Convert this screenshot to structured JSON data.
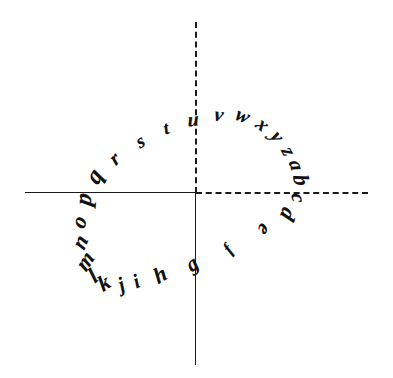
{
  "figure": {
    "title": "",
    "style": "hand-drawn-sketch",
    "background_color": "#ffffff",
    "ink_color": "#111111"
  },
  "axes": {
    "horizontal_left": {
      "name": "negative-x-axis",
      "stroke": "solid",
      "color": "#1a1a1a"
    },
    "horizontal_right": {
      "name": "positive-x-axis",
      "stroke": "dashed",
      "color": "#1a1a1a"
    },
    "vertical_up": {
      "name": "positive-y-axis",
      "stroke": "dashed",
      "color": "#1a1a1a"
    },
    "vertical_down": {
      "name": "negative-y-axis",
      "stroke": "solid",
      "color": "#1a1a1a"
    },
    "origin": {
      "x": 196,
      "y": 192
    }
  },
  "chart_data": {
    "type": "scatter",
    "title": "",
    "xlabel": "",
    "ylabel": "",
    "labels": [
      "f",
      "g",
      "h",
      "i",
      "j",
      "k",
      "l",
      "m",
      "n",
      "o",
      "p",
      "q",
      "r",
      "s",
      "t",
      "u",
      "v",
      "w",
      "x",
      "y",
      "z",
      "a",
      "b",
      "c",
      "d",
      "e"
    ],
    "points": [
      {
        "label": "f",
        "x": 228,
        "y": 249,
        "rotation": -55
      },
      {
        "label": "g",
        "x": 192,
        "y": 264,
        "rotation": -40
      },
      {
        "label": "h",
        "x": 160,
        "y": 275,
        "rotation": -32
      },
      {
        "label": "i",
        "x": 136,
        "y": 281,
        "rotation": -28
      },
      {
        "label": "j",
        "x": 121,
        "y": 284,
        "rotation": -28
      },
      {
        "label": "k",
        "x": 104,
        "y": 283,
        "rotation": -35
      },
      {
        "label": "l",
        "x": 93,
        "y": 276,
        "rotation": -42
      },
      {
        "label": "m",
        "x": 85,
        "y": 261,
        "rotation": -58
      },
      {
        "label": "n",
        "x": 80,
        "y": 242,
        "rotation": -68
      },
      {
        "label": "o",
        "x": 79,
        "y": 222,
        "rotation": -76
      },
      {
        "label": "p",
        "x": 83,
        "y": 199,
        "rotation": -86
      },
      {
        "label": "q",
        "x": 94,
        "y": 176,
        "rotation": -62
      },
      {
        "label": "r",
        "x": 114,
        "y": 158,
        "rotation": -45
      },
      {
        "label": "s",
        "x": 140,
        "y": 141,
        "rotation": -34
      },
      {
        "label": "t",
        "x": 166,
        "y": 128,
        "rotation": -22
      },
      {
        "label": "u",
        "x": 193,
        "y": 119,
        "rotation": -8
      },
      {
        "label": "v",
        "x": 219,
        "y": 114,
        "rotation": 5
      },
      {
        "label": "w",
        "x": 243,
        "y": 115,
        "rotation": 20
      },
      {
        "label": "x",
        "x": 263,
        "y": 124,
        "rotation": 38
      },
      {
        "label": "y",
        "x": 278,
        "y": 136,
        "rotation": 52
      },
      {
        "label": "z",
        "x": 289,
        "y": 151,
        "rotation": 62
      },
      {
        "label": "a",
        "x": 297,
        "y": 165,
        "rotation": 70
      },
      {
        "label": "b",
        "x": 301,
        "y": 180,
        "rotation": 76
      },
      {
        "label": "c",
        "x": 299,
        "y": 198,
        "rotation": 84
      },
      {
        "label": "d",
        "x": 288,
        "y": 214,
        "rotation": 108
      },
      {
        "label": "e",
        "x": 265,
        "y": 230,
        "rotation": 122
      }
    ],
    "sizes": {
      "f": 17,
      "g": 21,
      "h": 22,
      "i": 20,
      "j": 20,
      "k": 22,
      "l": 22,
      "m": 22,
      "n": 22,
      "o": 22,
      "p": 24,
      "q": 24,
      "r": 20,
      "s": 19,
      "t": 18,
      "u": 20,
      "v": 20,
      "w": 20,
      "x": 20,
      "y": 20,
      "z": 20,
      "a": 20,
      "b": 22,
      "c": 20,
      "d": 22,
      "e": 20
    },
    "grid": false,
    "legend": null,
    "xlim": [
      -196,
      197
    ],
    "ylim": [
      -186,
      192
    ]
  }
}
